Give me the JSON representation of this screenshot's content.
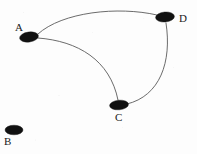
{
  "figure": {
    "width": 197,
    "height": 154,
    "background_color": "#fdfdfd",
    "node_color": "#111111",
    "edge_color": "#5a5a5a"
  },
  "nodes": [
    {
      "id": "A",
      "label": "A",
      "cx": 29,
      "cy": 37,
      "rx": 9.5,
      "ry": 5.0,
      "rotation": -8,
      "label_x": 15,
      "label_y": 22
    },
    {
      "id": "B",
      "label": "B",
      "cx": 14,
      "cy": 130,
      "rx": 9.0,
      "ry": 4.8,
      "rotation": 0,
      "label_x": 4,
      "label_y": 136
    },
    {
      "id": "C",
      "label": "C",
      "cx": 119,
      "cy": 105,
      "rx": 9.5,
      "ry": 4.8,
      "rotation": -5,
      "label_x": 115,
      "label_y": 112
    },
    {
      "id": "D",
      "label": "D",
      "cx": 165,
      "cy": 17,
      "rx": 9.5,
      "ry": 5.0,
      "rotation": -5,
      "label_x": 179,
      "label_y": 13
    }
  ],
  "edges": [
    {
      "id": "A-D",
      "from": "A",
      "to": "D",
      "path": "M 38 34 C 62 12, 118 6, 157 15"
    },
    {
      "id": "A-C",
      "from": "A",
      "to": "C",
      "path": "M 38 38 C 78 41, 110 60, 118 100"
    },
    {
      "id": "C-D",
      "from": "C",
      "to": "D",
      "path": "M 127 104 C 160 96, 172 62, 166 23"
    }
  ],
  "legend": {
    "node_count": 4,
    "edge_count": 3,
    "isolated_vertex": "B"
  }
}
